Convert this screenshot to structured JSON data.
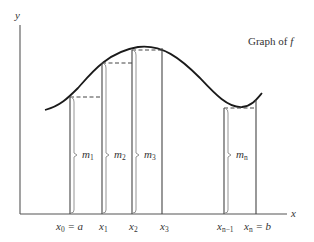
{
  "diagram": {
    "title_prefix": "Graph of ",
    "title_fn": "f",
    "axes": {
      "x_label": "x",
      "y_label": "y"
    },
    "partition_labels": [
      {
        "main": "x",
        "sub": "0",
        "suffix": " = a"
      },
      {
        "main": "x",
        "sub": "1",
        "suffix": ""
      },
      {
        "main": "x",
        "sub": "2",
        "suffix": ""
      },
      {
        "main": "x",
        "sub": "3",
        "suffix": ""
      },
      {
        "main": "x",
        "sub": "n−1",
        "suffix": ""
      },
      {
        "main": "x",
        "sub": "n",
        "suffix": " = b"
      }
    ],
    "height_labels": [
      {
        "main": "m",
        "sub": "1"
      },
      {
        "main": "m",
        "sub": "2"
      },
      {
        "main": "m",
        "sub": "3"
      },
      {
        "main": "m",
        "sub": "n"
      }
    ]
  }
}
